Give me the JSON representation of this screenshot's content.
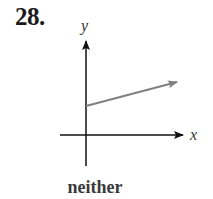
{
  "problem": {
    "number": "28."
  },
  "graph": {
    "x_axis_label": "x",
    "y_axis_label": "y",
    "line_color": "#808080",
    "axis_color": "#111111",
    "line": {
      "starts_on_y_axis": true,
      "direction": "increasing",
      "arrow_at_end": true
    }
  },
  "caption": "neither"
}
